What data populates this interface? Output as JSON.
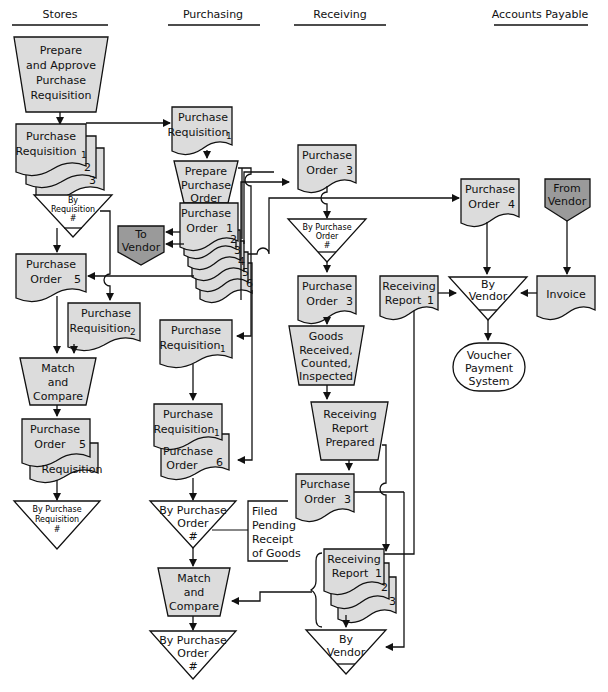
{
  "lanes": [
    {
      "title": "Stores"
    },
    {
      "title": "Purchasing"
    },
    {
      "title": "Receiving"
    },
    {
      "title": "Accounts Payable"
    }
  ],
  "stores": {
    "prepare_pr": [
      "Prepare",
      "and Approve",
      "Purchase",
      "Requisition"
    ],
    "pr_stack": {
      "line1": "Purchase",
      "line2": "Requisition",
      "copies": [
        "1",
        "2",
        "3"
      ]
    },
    "file_by_req": [
      "By",
      "Requisition",
      "#"
    ],
    "po5": {
      "line1": "Purchase",
      "line2": "Order",
      "copy": "5"
    },
    "pr2": {
      "line1": "Purchase",
      "line2": "Requisition",
      "copy": "2"
    },
    "match": [
      "Match",
      "and",
      "Compare"
    ],
    "po5_req": {
      "line1": "Purchase",
      "line2": "Order",
      "copy": "5",
      "back": "Requisition"
    },
    "file_by_pr": [
      "By Purchase",
      "Requisition",
      "#"
    ]
  },
  "purchasing": {
    "pr1_top": {
      "line1": "Purchase",
      "line2": "Requisition",
      "copy": "1"
    },
    "prepare_po": [
      "Prepare",
      "Purchase",
      "Order"
    ],
    "po_stack": {
      "line1": "Purchase",
      "line2": "Order",
      "copies": [
        "1",
        "2",
        "3",
        "4",
        "5",
        "6"
      ]
    },
    "to_vendor": [
      "To",
      "Vendor"
    ],
    "pr1_mid": {
      "line1": "Purchase",
      "line2": "Requisition",
      "copy": "1"
    },
    "pr1_po6": {
      "line1": "Purchase",
      "line2": "Requisition",
      "copy": "1",
      "line3": "Purchase",
      "line4": "Order",
      "copy2": "6"
    },
    "file_by_po": [
      "By Purchase",
      "Order",
      "#"
    ],
    "note": [
      "Filed",
      "Pending",
      "Receipt",
      "of Goods"
    ],
    "match": [
      "Match",
      "and",
      "Compare"
    ],
    "file_by_po2": [
      "By Purchase",
      "Order",
      "#"
    ]
  },
  "receiving": {
    "po3_top": {
      "line1": "Purchase",
      "line2": "Order",
      "copy": "3"
    },
    "file_by_po": [
      "By Purchase",
      "Order",
      "#"
    ],
    "po3_mid": {
      "line1": "Purchase",
      "line2": "Order",
      "copy": "3"
    },
    "goods": [
      "Goods",
      "Received,",
      "Counted,",
      "Inspected"
    ],
    "rr_prep": [
      "Receiving",
      "Report",
      "Prepared"
    ],
    "po3_bot": {
      "line1": "Purchase",
      "line2": "Order",
      "copy": "3"
    },
    "rr_stack": {
      "line1": "Receiving",
      "line2": "Report",
      "copies": [
        "1",
        "2",
        "3"
      ]
    },
    "file_by_vendor": [
      "By",
      "Vendor"
    ]
  },
  "accounts_payable": {
    "po4": {
      "line1": "Purchase",
      "line2": "Order",
      "copy": "4"
    },
    "from_vendor": [
      "From",
      "Vendor"
    ],
    "rr1": {
      "line1": "Receiving",
      "line2": "Report",
      "copy": "1"
    },
    "file_by_vendor": [
      "By",
      "Vendor"
    ],
    "invoice": "Invoice",
    "voucher": [
      "Voucher",
      "Payment",
      "System"
    ]
  },
  "colors": {
    "fill": "#dcdcdc",
    "connector": "#9a9a9a",
    "line": "#111111"
  }
}
